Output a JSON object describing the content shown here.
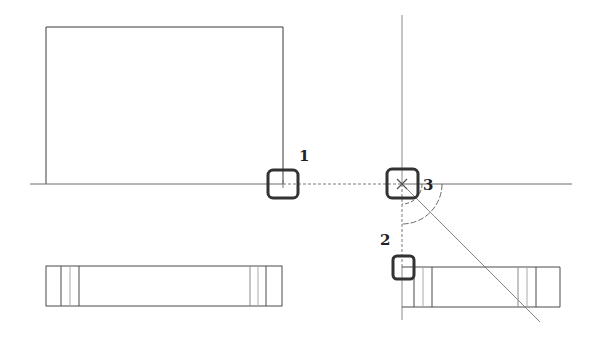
{
  "drawing": {
    "title": "Orthographic projection construction with snap points",
    "colors": {
      "line": "#3a3a3a",
      "thin_line": "#8a8a8a",
      "snap_box": "#333333",
      "background": "#ffffff"
    },
    "snap_points": [
      {
        "id": "1",
        "label": "1",
        "x": 283,
        "y": 184
      },
      {
        "id": "2",
        "label": "2",
        "x": 402,
        "y": 267
      },
      {
        "id": "3",
        "label": "3",
        "x": 402,
        "y": 184
      }
    ],
    "views": {
      "front_view": {
        "x": 46,
        "y": 27,
        "width": 237,
        "height": 157
      },
      "top_view": {
        "x": 46,
        "y": 266,
        "width": 236,
        "height": 40
      },
      "side_view": {
        "x": 414,
        "y": 267,
        "width": 146,
        "height": 40
      }
    },
    "miter_line_angle_deg": 45
  }
}
